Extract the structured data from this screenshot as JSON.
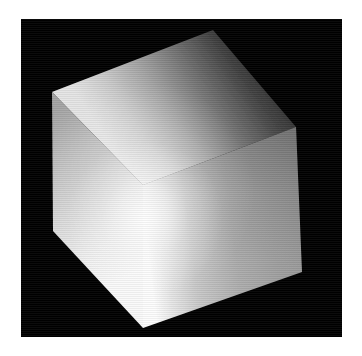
{
  "page": {
    "background_color": "#ffffff",
    "width": 362,
    "height": 356
  },
  "viewport": {
    "name": "render-viewport",
    "background_color": "#000000",
    "x": 21,
    "y": 19,
    "width": 321,
    "height": 318
  },
  "scene": {
    "object": "cube",
    "shading": "smooth-gouraud-grayscale",
    "render_artifact": "horizontal-interlace-scanlines",
    "colors": {
      "background": "#000000",
      "top_face_dark": "#2f2f2f",
      "top_face_mid": "#8a8a8a",
      "top_face_light": "#d8d8d8",
      "left_face_dark": "#9a9a9a",
      "left_face_mid": "#cfcfcf",
      "left_face_light": "#f4f4f4",
      "right_face_dark": "#8c8c8c",
      "right_face_mid": "#a8a8a8",
      "right_face_highlight": "#fbfbfb",
      "specular_highlight": "#ffffff"
    },
    "vertices": {
      "top": [
        192,
        11
      ],
      "upper_left": [
        31,
        73
      ],
      "upper_right": [
        275,
        108
      ],
      "center": [
        122,
        166
      ],
      "lower_left": [
        32,
        212
      ],
      "lower_right": [
        281,
        253
      ],
      "bottom": [
        122,
        309
      ]
    },
    "faces": [
      {
        "name": "top-face",
        "polygon": "192,11 275,108 122,166 31,73",
        "brightness_range": [
          0.18,
          0.86
        ]
      },
      {
        "name": "left-face",
        "polygon": "31,73 122,166 122,309 32,212",
        "brightness_range": [
          0.58,
          0.97
        ]
      },
      {
        "name": "right-face",
        "polygon": "122,166 275,108 281,253 122,309",
        "brightness_range": [
          0.52,
          0.99
        ]
      }
    ],
    "light": {
      "type": "point",
      "highlight_position": [
        124,
        200
      ],
      "highlight_radius": 70
    }
  }
}
